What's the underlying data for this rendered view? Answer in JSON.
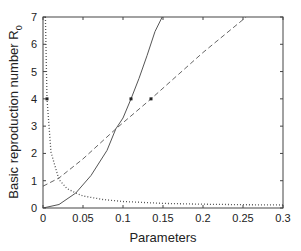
{
  "chart_data": {
    "type": "line",
    "title": "",
    "xlabel": "Parameters",
    "ylabel": "Basic reproduction number R",
    "ylabel_subscript": "0",
    "xlim": [
      0,
      0.3
    ],
    "ylim": [
      0,
      7
    ],
    "x_ticks": [
      0,
      0.05,
      0.1,
      0.15,
      0.2,
      0.25,
      0.3
    ],
    "x_tick_labels": [
      "0",
      "0.05",
      "0.1",
      "0.15",
      "0.2",
      "0.25",
      "0.3"
    ],
    "y_ticks": [
      0,
      1,
      2,
      3,
      4,
      5,
      6,
      7
    ],
    "y_tick_labels": [
      "0",
      "1",
      "2",
      "3",
      "4",
      "5",
      "6",
      "7"
    ],
    "grid": false,
    "legend": null,
    "series": [
      {
        "name": "dotted",
        "style": "dotted",
        "color": "#555555",
        "x": [
          0.003,
          0.005,
          0.01,
          0.02,
          0.03,
          0.041,
          0.05,
          0.075,
          0.1,
          0.15,
          0.2,
          0.25,
          0.3
        ],
        "y": [
          7.0,
          4.0,
          2.04,
          1.04,
          0.71,
          0.55,
          0.44,
          0.31,
          0.24,
          0.17,
          0.14,
          0.12,
          0.11
        ],
        "marker": {
          "x": 0.005,
          "y": 4
        }
      },
      {
        "name": "solid",
        "style": "solid",
        "color": "#555555",
        "x": [
          0,
          0.02,
          0.041,
          0.06,
          0.08,
          0.091,
          0.1,
          0.11,
          0.12,
          0.13,
          0.14,
          0.149
        ],
        "y": [
          0,
          0.13,
          0.55,
          1.19,
          2.11,
          2.9,
          3.3,
          4.0,
          4.75,
          5.58,
          6.47,
          7.0
        ],
        "marker": {
          "x": 0.11,
          "y": 4
        }
      },
      {
        "name": "dashed",
        "style": "dashed",
        "color": "#666666",
        "x": [
          0,
          0.02,
          0.05,
          0.091,
          0.135,
          0.2,
          0.254
        ],
        "y": [
          0.8,
          1.1,
          1.8,
          2.9,
          4.0,
          5.7,
          7.0
        ],
        "marker": {
          "x": 0.135,
          "y": 4
        }
      }
    ]
  },
  "labels": {
    "xlabel": "Parameters",
    "ylabel": "Basic reproduction number R",
    "ylabel_sub": "0"
  }
}
